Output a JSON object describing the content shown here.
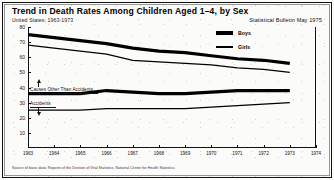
{
  "figure": {
    "title": "Trend in Death Rates Among Children Aged 1–4, by Sex",
    "subtitle": "United States, 1963-1973",
    "bulletin": "Statistical Bulletin May 1975",
    "source": "Source of basic data: Reports of the Division of Vital Statistics, National Center for Health Statistics.",
    "border_color": "#111111",
    "paper_color": "#fbfbf9"
  },
  "legend": {
    "position": "top-right",
    "entries": [
      {
        "label": "Boys",
        "style": "thick-line",
        "color": "#000000"
      },
      {
        "label": "Girls",
        "style": "thin-line",
        "color": "#000000"
      }
    ]
  },
  "annotations": [
    {
      "id": "causes-other",
      "text": "Causes Other Than Accidents",
      "arrow": "up"
    },
    {
      "id": "accidents",
      "text": "Accidents",
      "arrow": "down"
    }
  ],
  "chart_data": {
    "type": "line",
    "title": "Trend in Death Rates Among Children Aged 1–4, by Sex",
    "subtitle": "United States, 1963-1973",
    "xlabel": "",
    "ylabel": "",
    "grid": false,
    "legend_position": "top-right",
    "x": [
      1963,
      1964,
      1965,
      1966,
      1967,
      1968,
      1969,
      1970,
      1971,
      1972,
      1973
    ],
    "xticks": [
      1963,
      1964,
      1965,
      1966,
      1967,
      1968,
      1969,
      1970,
      1971,
      1972,
      1973,
      1974
    ],
    "xlim": [
      1963,
      1974
    ],
    "ylim": [
      0,
      80
    ],
    "yticks": [
      10,
      20,
      30,
      40,
      50,
      60,
      70,
      80
    ],
    "series": [
      {
        "name": "Boys — Causes Other Than Accidents",
        "style": "thick-line",
        "values": [
          75,
          73,
          71,
          69,
          66,
          64,
          63,
          61,
          59,
          58,
          56
        ]
      },
      {
        "name": "Girls — Causes Other Than Accidents",
        "style": "thin-line",
        "values": [
          68,
          66,
          64,
          62,
          58,
          57,
          56,
          55,
          53,
          52,
          50
        ]
      },
      {
        "name": "Boys — Accidents",
        "style": "thick-line",
        "values": [
          36,
          36,
          36,
          38,
          37,
          36,
          36,
          37,
          38,
          38,
          38
        ]
      },
      {
        "name": "Girls — Accidents",
        "style": "thin-line",
        "values": [
          25,
          25,
          25,
          26,
          26,
          26,
          26,
          27,
          28,
          29,
          30
        ]
      }
    ]
  }
}
